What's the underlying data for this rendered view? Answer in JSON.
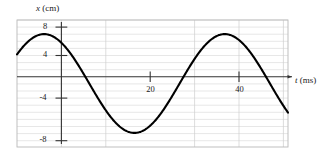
{
  "chart_data": {
    "type": "line",
    "title": "",
    "subtitle": "",
    "xlabel": "t (ms)",
    "ylabel": "x (cm)",
    "xlabel_symbol": "t",
    "xlabel_unit": "(ms)",
    "ylabel_symbol": "x",
    "ylabel_unit": "(cm)",
    "xlim": [
      -6,
      54
    ],
    "ylim": [
      -9,
      9
    ],
    "xticks": [
      20,
      40
    ],
    "xtick_labels": [
      "20",
      "40"
    ],
    "yticks": [
      8,
      4,
      -4,
      -8
    ],
    "ytick_labels": [
      "8",
      "4",
      "-4",
      "-8"
    ],
    "grid": true,
    "grid_y_step": 1,
    "grid_x_step": 10,
    "legend": "none",
    "series": [
      {
        "name": "displacement",
        "color": "#000000",
        "amplitude": 7,
        "period": 40,
        "phase_deg": 90,
        "offset": 0,
        "equation": "x = 7 cos(2*pi*t/40)",
        "x": [
          -6,
          -4,
          -2,
          0,
          2,
          4,
          6,
          8,
          10,
          12,
          14,
          16,
          18,
          20,
          22,
          24,
          26,
          28,
          30,
          32,
          34,
          36,
          38,
          40,
          42,
          44,
          46,
          48,
          50
        ],
        "values": [
          0.0,
          2.16,
          4.11,
          7.0,
          6.66,
          5.66,
          4.11,
          2.16,
          0.0,
          -2.16,
          -4.11,
          -5.66,
          -6.66,
          -7.0,
          -6.66,
          -5.66,
          -4.11,
          -2.16,
          0.0,
          2.16,
          4.11,
          5.66,
          6.66,
          7.0,
          6.66,
          5.66,
          4.11,
          2.16,
          0.0
        ]
      }
    ],
    "annotations": []
  },
  "figure": {
    "frame_color": "#b9b9b9",
    "grid_color": "#d8d8d8",
    "axis_color": "#333333",
    "curve_color": "#000000",
    "background": "#ffffff"
  }
}
